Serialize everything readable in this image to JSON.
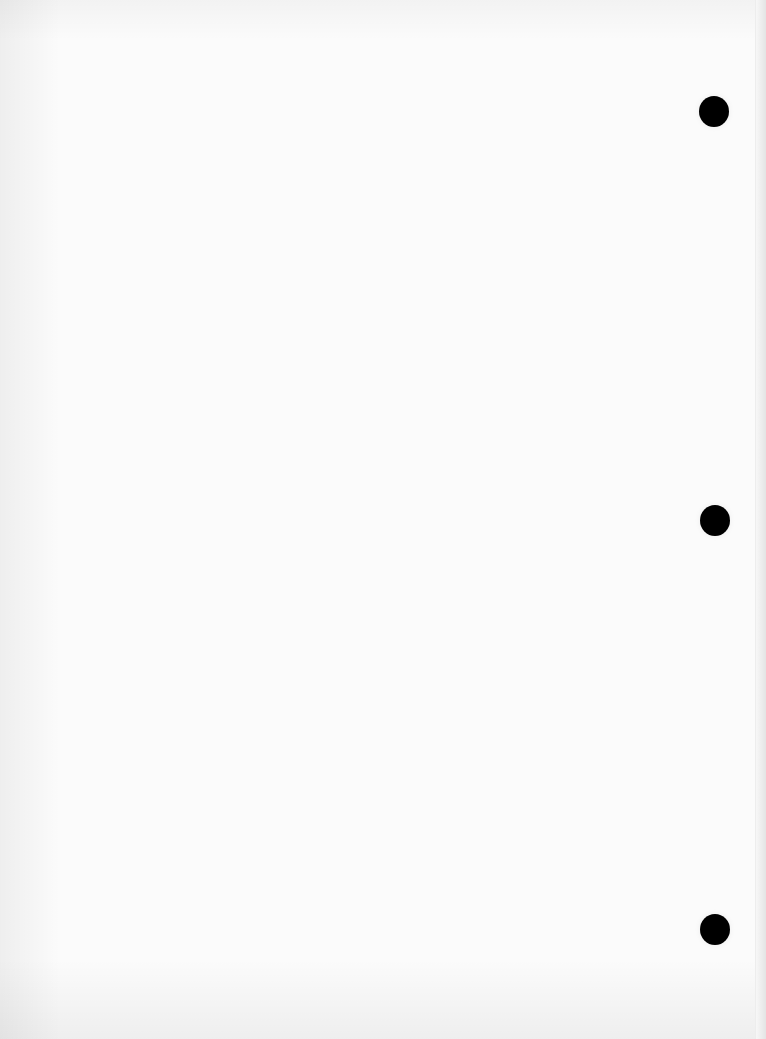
{
  "document": {
    "type": "blank-scanned-page",
    "text": "",
    "punch_holes": [
      {
        "position": "top",
        "color": "#000000"
      },
      {
        "position": "middle",
        "color": "#000000"
      },
      {
        "position": "bottom",
        "color": "#000000"
      }
    ],
    "colors": {
      "paper": "#fbfbfb",
      "hole": "#000000"
    }
  }
}
